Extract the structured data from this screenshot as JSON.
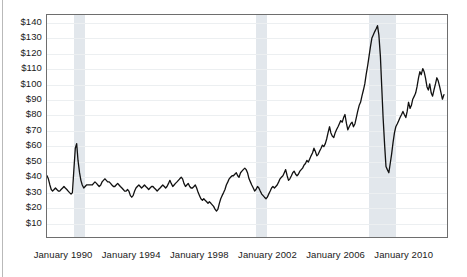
{
  "chart_data": {
    "type": "line",
    "title": "",
    "subtitle": "",
    "xlabel": "",
    "ylabel": "",
    "ylim": [
      0,
      145
    ],
    "xlim": [
      1989.0,
      2012.6
    ],
    "grid": true,
    "legend": null,
    "y_tick_labels": [
      "$140",
      "$130",
      "$120",
      "$110",
      "$100",
      "$90",
      "$80",
      "$70",
      "$60",
      "$50",
      "$40",
      "$30",
      "$20",
      "$10"
    ],
    "y_tick_values": [
      140,
      130,
      120,
      110,
      100,
      90,
      80,
      70,
      60,
      50,
      40,
      30,
      20,
      10
    ],
    "x_tick_labels": [
      "January 1990",
      "January 1994",
      "January 1998",
      "January 2002",
      "January 2006",
      "January 2010"
    ],
    "x_tick_values": [
      1990.0,
      1994.0,
      1998.0,
      2002.0,
      2006.0,
      2010.0
    ],
    "line_color": "#111111",
    "line_width": 1.3,
    "band_color": "#e2e7ec",
    "shaded_regions": [
      {
        "label": "recession",
        "x0": 1990.58,
        "x1": 1991.25
      },
      {
        "label": "recession",
        "x0": 2001.25,
        "x1": 2001.92
      },
      {
        "label": "recession",
        "x0": 2007.92,
        "x1": 2009.5
      }
    ],
    "series": [
      {
        "name": "price",
        "units": "dollars per barrel",
        "x": [
          1989.0,
          1989.08,
          1989.17,
          1989.25,
          1989.33,
          1989.42,
          1989.5,
          1989.58,
          1989.67,
          1989.75,
          1989.83,
          1989.92,
          1990.0,
          1990.08,
          1990.17,
          1990.25,
          1990.33,
          1990.42,
          1990.5,
          1990.58,
          1990.67,
          1990.75,
          1990.83,
          1990.92,
          1991.0,
          1991.08,
          1991.17,
          1991.25,
          1991.33,
          1991.42,
          1991.5,
          1991.58,
          1991.67,
          1991.75,
          1991.83,
          1991.92,
          1992.0,
          1992.08,
          1992.17,
          1992.25,
          1992.33,
          1992.42,
          1992.5,
          1992.58,
          1992.67,
          1992.75,
          1992.83,
          1992.92,
          1993.0,
          1993.08,
          1993.17,
          1993.25,
          1993.33,
          1993.42,
          1993.5,
          1993.58,
          1993.67,
          1993.75,
          1993.83,
          1993.92,
          1994.0,
          1994.08,
          1994.17,
          1994.25,
          1994.33,
          1994.42,
          1994.5,
          1994.58,
          1994.67,
          1994.75,
          1994.83,
          1994.92,
          1995.0,
          1995.08,
          1995.17,
          1995.25,
          1995.33,
          1995.42,
          1995.5,
          1995.58,
          1995.67,
          1995.75,
          1995.83,
          1995.92,
          1996.0,
          1996.08,
          1996.17,
          1996.25,
          1996.33,
          1996.42,
          1996.5,
          1996.58,
          1996.67,
          1996.75,
          1996.83,
          1996.92,
          1997.0,
          1997.08,
          1997.17,
          1997.25,
          1997.33,
          1997.42,
          1997.5,
          1997.58,
          1997.67,
          1997.75,
          1997.83,
          1997.92,
          1998.0,
          1998.08,
          1998.17,
          1998.25,
          1998.33,
          1998.42,
          1998.5,
          1998.58,
          1998.67,
          1998.75,
          1998.83,
          1998.92,
          1999.0,
          1999.08,
          1999.17,
          1999.25,
          1999.33,
          1999.42,
          1999.5,
          1999.58,
          1999.67,
          1999.75,
          1999.83,
          1999.92,
          2000.0,
          2000.08,
          2000.17,
          2000.25,
          2000.33,
          2000.42,
          2000.5,
          2000.58,
          2000.67,
          2000.75,
          2000.83,
          2000.92,
          2001.0,
          2001.08,
          2001.17,
          2001.25,
          2001.33,
          2001.42,
          2001.5,
          2001.58,
          2001.67,
          2001.75,
          2001.83,
          2001.92,
          2002.0,
          2002.08,
          2002.17,
          2002.25,
          2002.33,
          2002.42,
          2002.5,
          2002.58,
          2002.67,
          2002.75,
          2002.83,
          2002.92,
          2003.0,
          2003.08,
          2003.17,
          2003.25,
          2003.33,
          2003.42,
          2003.5,
          2003.58,
          2003.67,
          2003.75,
          2003.83,
          2003.92,
          2004.0,
          2004.08,
          2004.17,
          2004.25,
          2004.33,
          2004.42,
          2004.5,
          2004.58,
          2004.67,
          2004.75,
          2004.83,
          2004.92,
          2005.0,
          2005.08,
          2005.17,
          2005.25,
          2005.33,
          2005.42,
          2005.5,
          2005.58,
          2005.67,
          2005.75,
          2005.83,
          2005.92,
          2006.0,
          2006.08,
          2006.17,
          2006.25,
          2006.33,
          2006.42,
          2006.5,
          2006.58,
          2006.67,
          2006.75,
          2006.83,
          2006.92,
          2007.0,
          2007.08,
          2007.17,
          2007.25,
          2007.33,
          2007.42,
          2007.5,
          2007.58,
          2007.67,
          2007.75,
          2007.83,
          2007.92,
          2008.0,
          2008.08,
          2008.17,
          2008.25,
          2008.33,
          2008.42,
          2008.5,
          2008.58,
          2008.67,
          2008.75,
          2008.83,
          2008.92,
          2009.0,
          2009.08,
          2009.17,
          2009.25,
          2009.33,
          2009.42,
          2009.5,
          2009.58,
          2009.67,
          2009.75,
          2009.83,
          2009.92,
          2010.0,
          2010.08,
          2010.17,
          2010.25,
          2010.33,
          2010.42,
          2010.5,
          2010.58,
          2010.67,
          2010.75,
          2010.83,
          2010.92,
          2011.0,
          2011.08,
          2011.17,
          2011.25,
          2011.33,
          2011.42,
          2011.5,
          2011.58,
          2011.67,
          2011.75,
          2011.83,
          2011.92,
          2012.0,
          2012.08,
          2012.17,
          2012.25,
          2012.33,
          2012.42
        ],
        "y": [
          40,
          38,
          34,
          31,
          30,
          31,
          32,
          31,
          30,
          30,
          31,
          32,
          33,
          32,
          31,
          30,
          29,
          28,
          29,
          43,
          58,
          61,
          50,
          42,
          37,
          34,
          32,
          33,
          34,
          34,
          34,
          34,
          34,
          35,
          36,
          35,
          34,
          33,
          34,
          36,
          37,
          38,
          37,
          36,
          36,
          35,
          34,
          33,
          33,
          34,
          35,
          34,
          33,
          32,
          31,
          30,
          30,
          31,
          30,
          27,
          26,
          27,
          30,
          32,
          33,
          34,
          33,
          32,
          33,
          34,
          33,
          32,
          31,
          32,
          33,
          33,
          32,
          31,
          30,
          31,
          32,
          33,
          34,
          33,
          32,
          33,
          35,
          37,
          35,
          33,
          34,
          35,
          36,
          37,
          38,
          39,
          38,
          35,
          33,
          34,
          35,
          33,
          32,
          32,
          33,
          34,
          32,
          29,
          27,
          25,
          24,
          25,
          24,
          23,
          22,
          23,
          22,
          21,
          20,
          18,
          17,
          18,
          22,
          25,
          27,
          29,
          31,
          34,
          36,
          38,
          39,
          40,
          40,
          41,
          42,
          40,
          39,
          42,
          43,
          44,
          45,
          44,
          42,
          38,
          36,
          34,
          32,
          30,
          31,
          33,
          32,
          30,
          28,
          27,
          26,
          25,
          26,
          28,
          30,
          32,
          33,
          32,
          33,
          34,
          36,
          38,
          39,
          40,
          42,
          44,
          40,
          37,
          38,
          40,
          42,
          43,
          41,
          40,
          41,
          43,
          44,
          45,
          47,
          48,
          50,
          49,
          51,
          53,
          55,
          58,
          56,
          53,
          54,
          56,
          58,
          60,
          59,
          61,
          64,
          68,
          72,
          68,
          66,
          65,
          68,
          70,
          72,
          74,
          76,
          75,
          78,
          80,
          74,
          70,
          72,
          74,
          75,
          72,
          74,
          78,
          82,
          86,
          88,
          92,
          96,
          100,
          106,
          112,
          118,
          124,
          130,
          132,
          134,
          136,
          138,
          132,
          118,
          98,
          78,
          60,
          46,
          44,
          42,
          48,
          54,
          62,
          68,
          72,
          74,
          76,
          78,
          80,
          82,
          80,
          78,
          82,
          88,
          84,
          86,
          90,
          92,
          94,
          98,
          104,
          108,
          106,
          110,
          108,
          104,
          98,
          96,
          100,
          94,
          92,
          96,
          100,
          104,
          102,
          98,
          94,
          90,
          93
        ]
      }
    ]
  },
  "axes": {
    "y_labels": [
      "$140",
      "$130",
      "$120",
      "$110",
      "$100",
      "$90",
      "$80",
      "$70",
      "$60",
      "$50",
      "$40",
      "$30",
      "$20",
      "$10"
    ],
    "x_labels": [
      "January 1990",
      "January 1994",
      "January 1998",
      "January 2002",
      "January 2006",
      "January 2010"
    ]
  }
}
